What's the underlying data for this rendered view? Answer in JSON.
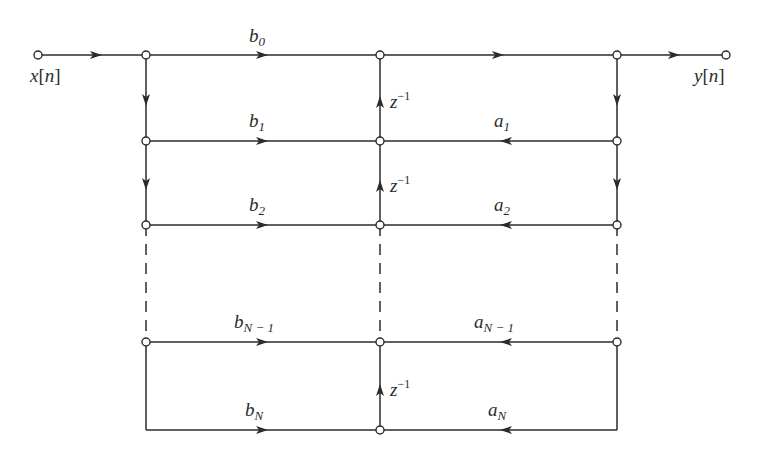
{
  "diagram": {
    "type": "signal-flow-graph",
    "colors": {
      "line": "#2b2b2b",
      "node_fill": "#ffffff",
      "background": "#ffffff"
    },
    "input": {
      "var": "x",
      "index": "n"
    },
    "output": {
      "var": "y",
      "index": "n"
    },
    "delay": {
      "base": "z",
      "exp": "−1"
    },
    "feedforward": [
      {
        "base": "b",
        "sub": "0"
      },
      {
        "base": "b",
        "sub": "1"
      },
      {
        "base": "b",
        "sub": "2"
      },
      {
        "base": "b",
        "sub": "N − 1"
      },
      {
        "base": "b",
        "sub": "N"
      }
    ],
    "feedback": [
      {
        "base": "a",
        "sub": "1"
      },
      {
        "base": "a",
        "sub": "2"
      },
      {
        "base": "a",
        "sub": "N − 1"
      },
      {
        "base": "a",
        "sub": "N"
      }
    ]
  }
}
